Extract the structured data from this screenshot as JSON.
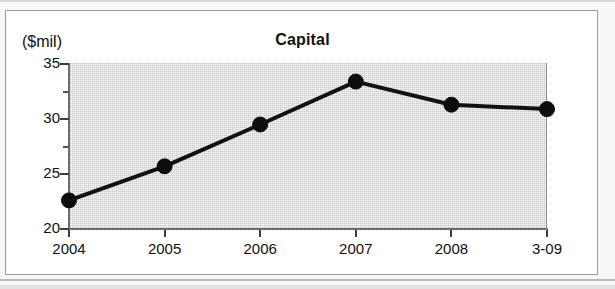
{
  "chart": {
    "title": "Capital",
    "unit_label": "($mil)"
  },
  "axis": {
    "y_ticks": [
      "35",
      "30",
      "25",
      "20"
    ],
    "x_ticks": [
      "2004",
      "2005",
      "2006",
      "2007",
      "2008",
      "3-09"
    ]
  },
  "chart_data": {
    "type": "line",
    "title": "Capital",
    "subtitle": "",
    "xlabel": "",
    "ylabel": "($mil)",
    "categories": [
      "2004",
      "2005",
      "2006",
      "2007",
      "2008",
      "3-09"
    ],
    "values": [
      22.6,
      25.7,
      29.5,
      33.4,
      31.3,
      30.9
    ],
    "ylim": [
      20,
      35
    ],
    "y_major_ticks": [
      20,
      25,
      30,
      35
    ],
    "y_minor_ticks": [
      22.5,
      27.5,
      32.5
    ],
    "grid": false,
    "legend": "none",
    "marker": "filled-circle",
    "line_color": "#111111",
    "plot_background": "#c9c9c9",
    "figure_background": "#ffffff"
  }
}
